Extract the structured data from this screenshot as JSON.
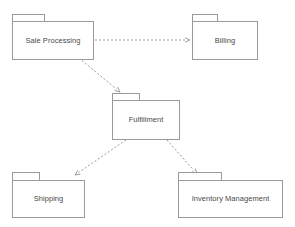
{
  "diagram": {
    "kind": "uml-package-diagram",
    "width": 295,
    "height": 227,
    "background_color": "#ffffff",
    "line_color": "#9a9a9a",
    "text_color": "#4a4a4a",
    "packages": [
      {
        "id": "sale-processing",
        "label": "Sale Processing",
        "x": 12,
        "y": 14,
        "tab_width": 33,
        "tab_height": 7,
        "body_width": 82,
        "body_height": 39
      },
      {
        "id": "billing",
        "label": "Billing",
        "x": 192,
        "y": 14,
        "tab_width": 26,
        "tab_height": 7,
        "body_width": 66,
        "body_height": 39
      },
      {
        "id": "fulfillment",
        "label": "Fulfillment",
        "x": 112,
        "y": 93,
        "tab_width": 28,
        "tab_height": 7,
        "body_width": 68,
        "body_height": 40
      },
      {
        "id": "shipping",
        "label": "Shipping",
        "x": 12,
        "y": 172,
        "tab_width": 28,
        "tab_height": 8,
        "body_width": 73,
        "body_height": 38
      },
      {
        "id": "inventory-management",
        "label": "Inventory Management",
        "x": 178,
        "y": 172,
        "tab_width": 44,
        "tab_height": 8,
        "body_width": 105,
        "body_height": 38
      }
    ],
    "dependencies": [
      {
        "id": "sale-processing-to-billing",
        "from": "sale-processing",
        "to": "billing",
        "style": "dashed",
        "arrow": "open",
        "x1": 95,
        "y1": 40,
        "x2": 190,
        "y2": 40
      },
      {
        "id": "sale-processing-to-fulfillment",
        "from": "sale-processing",
        "to": "fulfillment",
        "style": "dashed",
        "arrow": "open",
        "x1": 79,
        "y1": 58,
        "x2": 120,
        "y2": 92
      },
      {
        "id": "fulfillment-to-shipping",
        "from": "fulfillment",
        "to": "shipping",
        "style": "dashed",
        "arrow": "open",
        "x1": 126,
        "y1": 140,
        "x2": 75,
        "y2": 175
      },
      {
        "id": "fulfillment-to-inventory-management",
        "from": "fulfillment",
        "to": "inventory-management",
        "style": "dashed",
        "arrow": "open",
        "x1": 167,
        "y1": 140,
        "x2": 197,
        "y2": 174
      }
    ]
  }
}
